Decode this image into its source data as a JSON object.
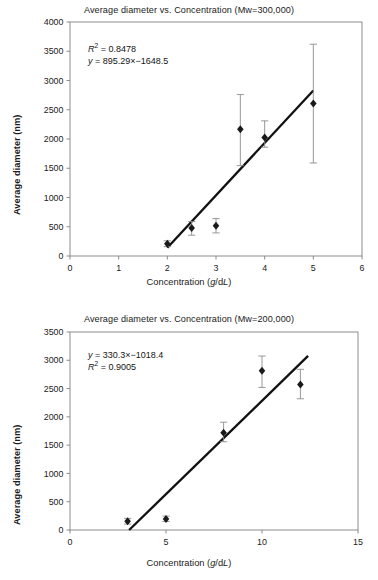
{
  "figure": {
    "panels": [
      {
        "id": "top",
        "title": "Average diameter vs. Concentration (Mw=300,000)",
        "ylabel": "Average diameter (nm)",
        "xlabel_parts": {
          "pre": "Concentration (",
          "italic1": "g",
          "mid": "/d",
          "italic2": "L",
          "post": ")"
        },
        "annotation_line1": {
          "prefix": "R",
          "sup": "2",
          "rest": " = 0.8478"
        },
        "annotation_line2": {
          "italic": "y",
          "rest": " = 895.29×−1648.5"
        },
        "chart_data": {
          "type": "scatter",
          "title": "Average diameter vs. Concentration (Mw=300,000)",
          "xlabel": "Concentration (g/dL)",
          "ylabel": "Average diameter (nm)",
          "xlim": [
            0,
            6
          ],
          "ylim": [
            0,
            4000
          ],
          "xticks": [
            0,
            1,
            2,
            3,
            4,
            5,
            6
          ],
          "yticks": [
            0,
            500,
            1000,
            1500,
            2000,
            2500,
            3000,
            3500,
            4000
          ],
          "grid": false,
          "legend": null,
          "marker": "filled-diamond",
          "points": [
            {
              "x": 2.0,
              "y": 210,
              "yerr_low": 160,
              "yerr_high": 260
            },
            {
              "x": 2.5,
              "y": 480,
              "yerr_low": 355,
              "yerr_high": 590
            },
            {
              "x": 3.0,
              "y": 515,
              "yerr_low": 395,
              "yerr_high": 640
            },
            {
              "x": 3.5,
              "y": 2165,
              "yerr_low": 1545,
              "yerr_high": 2760
            },
            {
              "x": 4.0,
              "y": 2025,
              "yerr_low": 1860,
              "yerr_high": 2310
            },
            {
              "x": 5.0,
              "y": 2605,
              "yerr_low": 1590,
              "yerr_high": 3620
            }
          ],
          "fit": {
            "type": "linear",
            "slope": 895.29,
            "intercept": -1648.5,
            "equation": "y = 895.29x − 1648.5",
            "r_squared": 0.8478,
            "x_start": 2.0,
            "x_end": 5.0
          }
        }
      },
      {
        "id": "bottom",
        "title": "Average diameter vs. Concentration (Mw=200,000)",
        "ylabel": "Average diameter (nm)",
        "xlabel_parts": {
          "pre": "Concentration (",
          "italic1": "g",
          "mid": "/d",
          "italic2": "L",
          "post": ")"
        },
        "annotation_line1": {
          "italic": "y",
          "rest": " = 330.3×−1018.4"
        },
        "annotation_line2": {
          "prefix": "R",
          "sup": "2",
          "rest": " = 0.9005"
        },
        "chart_data": {
          "type": "scatter",
          "title": "Average diameter vs. Concentration (Mw=200,000)",
          "xlabel": "Concentration (g/dL)",
          "ylabel": "Average diameter (nm)",
          "xlim": [
            0,
            15
          ],
          "ylim": [
            0,
            3500
          ],
          "xticks": [
            0,
            5,
            10,
            15
          ],
          "yticks": [
            0,
            500,
            1000,
            1500,
            2000,
            2500,
            3000,
            3500
          ],
          "grid": false,
          "legend": null,
          "marker": "filled-diamond",
          "points": [
            {
              "x": 3.0,
              "y": 155,
              "yerr_low": 105,
              "yerr_high": 205
            },
            {
              "x": 5.0,
              "y": 195,
              "yerr_low": 150,
              "yerr_high": 245
            },
            {
              "x": 8.0,
              "y": 1720,
              "yerr_low": 1560,
              "yerr_high": 1905
            },
            {
              "x": 10.0,
              "y": 2815,
              "yerr_low": 2520,
              "yerr_high": 3075
            },
            {
              "x": 12.0,
              "y": 2570,
              "yerr_low": 2320,
              "yerr_high": 2840
            }
          ],
          "fit": {
            "type": "linear",
            "slope": 330.3,
            "intercept": -1018.4,
            "equation": "y = 330.3x − 1018.4",
            "r_squared": 0.9005,
            "x_start": 3.08,
            "x_end": 12.4
          }
        }
      }
    ],
    "colors": {
      "axis": "#808080",
      "marker": "#1a1a1a",
      "fit_line": "#111111",
      "errorbar": "#8c8c8c",
      "text": "#1b1b1b"
    }
  }
}
